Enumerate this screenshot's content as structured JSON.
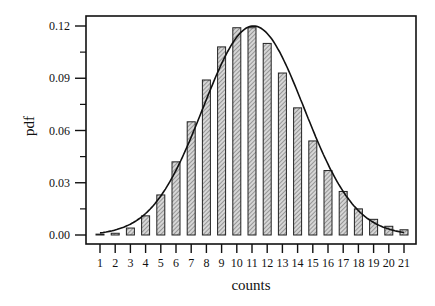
{
  "chart_data": {
    "type": "bar",
    "title": "",
    "xlabel": "counts",
    "ylabel": "pdf",
    "categories": [
      "1",
      "2",
      "3",
      "4",
      "5",
      "6",
      "7",
      "8",
      "9",
      "10",
      "11",
      "12",
      "13",
      "14",
      "15",
      "16",
      "17",
      "18",
      "19",
      "20",
      "21"
    ],
    "series": [
      {
        "name": "empirical pdf (bars)",
        "type": "bar",
        "values": [
          0.0005,
          0.001,
          0.004,
          0.011,
          0.023,
          0.042,
          0.065,
          0.089,
          0.108,
          0.119,
          0.119,
          0.11,
          0.093,
          0.073,
          0.054,
          0.037,
          0.025,
          0.015,
          0.009,
          0.005,
          0.003
        ]
      },
      {
        "name": "fitted pdf (curve)",
        "type": "line",
        "peak_x": 11.1,
        "peak_y": 0.12,
        "values": [
          0.0003,
          0.0012,
          0.004,
          0.01,
          0.021,
          0.039,
          0.062,
          0.087,
          0.108,
          0.119,
          0.12,
          0.112,
          0.095,
          0.074,
          0.053,
          0.035,
          0.022,
          0.012,
          0.006,
          0.003,
          0.0014
        ]
      }
    ],
    "yticks": [
      "0.00",
      "0.03",
      "0.06",
      "0.09",
      "0.12"
    ],
    "ytick_values": [
      0.0,
      0.03,
      0.06,
      0.09,
      0.12
    ],
    "ylim": [
      -0.0025,
      0.1275
    ],
    "xlim": [
      0.0,
      21.8
    ],
    "grid": false,
    "legend": null,
    "bar_fill": "hatched-gray",
    "colors": {
      "axis": "#111111",
      "bar_edge": "#222222",
      "bar_fill": "#bdbdbd",
      "curve": "#111111"
    }
  }
}
